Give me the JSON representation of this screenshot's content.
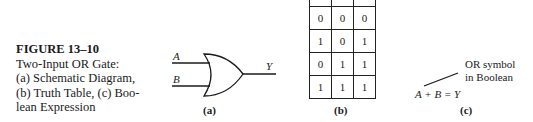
{
  "caption": {
    "figure_label": "FIGURE 13–10",
    "lines": [
      "Two-Input OR Gate:",
      "(a) Schematic Diagram,",
      "(b) Truth Table, (c) Boo-",
      "lean Expression"
    ]
  },
  "schematic": {
    "input_a": "A",
    "input_b": "B",
    "output": "Y",
    "sublabel": "(a)"
  },
  "truth_table": {
    "rows": [
      [
        "",
        "",
        ""
      ],
      [
        "0",
        "0",
        "0"
      ],
      [
        "1",
        "0",
        "1"
      ],
      [
        "0",
        "1",
        "1"
      ],
      [
        "1",
        "1",
        "1"
      ]
    ],
    "sublabel": "(b)"
  },
  "boolean": {
    "expression": "A + B = Y",
    "note_line1": "OR symbol",
    "note_line2": "in Boolean",
    "sublabel": "(c)"
  }
}
